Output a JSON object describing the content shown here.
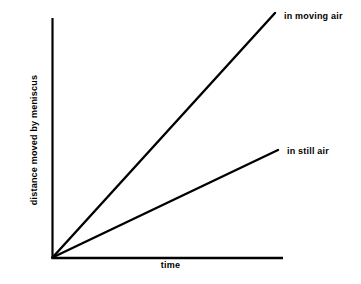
{
  "figure": {
    "background_color": "#ffffff",
    "ink_color": "#000000"
  },
  "chart_data": {
    "type": "line",
    "title": "",
    "subtitle": "",
    "xlabel": "time",
    "ylabel": "distance moved by meniscus",
    "xlim": [
      0,
      1
    ],
    "ylim": [
      0,
      1
    ],
    "grid": false,
    "xticks": [],
    "yticks": [],
    "xticklabels": [],
    "yticklabels": [],
    "legend_position": "at-line-ends",
    "axes_pixels": {
      "origin_x": 52,
      "origin_y": 258,
      "y_axis_top": 18,
      "x_axis_right": 283
    },
    "series": [
      {
        "name": "in moving air",
        "label": "in moving air",
        "color": "#000000",
        "line_width": 2.4,
        "x": [
          0,
          1
        ],
        "y": [
          0,
          1
        ],
        "slope_relative": 1.0,
        "pixel_start": [
          52,
          258
        ],
        "pixel_end": [
          275,
          13
        ]
      },
      {
        "name": "in still air",
        "label": "in still air",
        "color": "#000000",
        "line_width": 2.4,
        "x": [
          0,
          1
        ],
        "y": [
          0,
          0.44
        ],
        "slope_relative": 0.44,
        "pixel_start": [
          52,
          258
        ],
        "pixel_end": [
          278,
          150
        ]
      }
    ],
    "annotations": [
      {
        "text": "in moving air",
        "anchor": "end-of-moving-air-line"
      },
      {
        "text": "in still air",
        "anchor": "end-of-still-air-line"
      }
    ]
  }
}
